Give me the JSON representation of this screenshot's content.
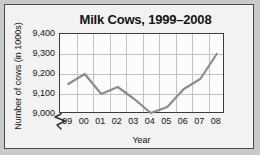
{
  "figure": {
    "title": "Milk Cows, 1999–2008",
    "background_color": "#f2f2f2",
    "border_color": "#4a4a4a"
  },
  "axes": {
    "ylabel": "Number of cows (in 1000s)",
    "xlabel": "Year",
    "y_ticks": [
      "9,000",
      "9,100",
      "9,200",
      "9,300",
      "9,400"
    ],
    "x_ticks": [
      "99",
      "00",
      "01",
      "02",
      "03",
      "04",
      "05",
      "06",
      "07",
      "08"
    ],
    "break_symbol": "axis-break-zigzag-icon"
  },
  "chart_data": {
    "type": "line",
    "title": "Milk Cows, 1999–2008",
    "xlabel": "Year",
    "ylabel": "Number of cows (in 1000s)",
    "categories": [
      "99",
      "00",
      "01",
      "02",
      "03",
      "04",
      "05",
      "06",
      "07",
      "08"
    ],
    "x_full_years": [
      1999,
      2000,
      2001,
      2002,
      2003,
      2004,
      2005,
      2006,
      2007,
      2008
    ],
    "values": [
      9150,
      9200,
      9100,
      9135,
      9075,
      9005,
      9035,
      9125,
      9175,
      9300
    ],
    "ylim": [
      9000,
      9400
    ],
    "y_tick_values": [
      9000,
      9100,
      9200,
      9300,
      9400
    ],
    "y_axis_broken": true,
    "grid": true,
    "legend": "none",
    "series_color": "#8c8c8c",
    "gridline_color": "#c2c2c2",
    "units": "thousands of cows"
  }
}
